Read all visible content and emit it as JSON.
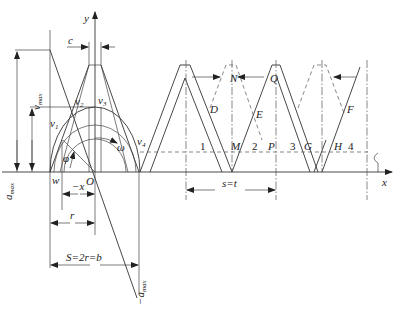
{
  "figure": {
    "type": "engineering diagram"
  },
  "axes": {
    "x_label": "x",
    "y_label": "y",
    "origin_label": "O"
  },
  "labels": {
    "v_max": "v",
    "v_max_sub": "max",
    "a_max": "a",
    "a_max_sub": "max",
    "neg_a_max": "−a",
    "neg_a_max_sub": "max",
    "c": "c",
    "v1": "v",
    "v1_sub": "1",
    "v2": "v",
    "v2_sub": "2",
    "v3": "v",
    "v3_sub": "3",
    "v4": "v",
    "v4_sub": "4",
    "omega": "ω",
    "phi": "φ",
    "w": "w",
    "neg_x": "−x",
    "r": "r",
    "S_eq": "S=2r=b",
    "s_eq_t": "s=t",
    "points": [
      "D",
      "N",
      "Q",
      "E",
      "F",
      "M",
      "P",
      "G",
      "H"
    ],
    "zones": [
      "1",
      "2",
      "3",
      "4"
    ]
  },
  "point_labels": {
    "D": "D",
    "N": "N",
    "Q": "Q",
    "E": "E",
    "F": "F",
    "M": "M",
    "P": "P",
    "G": "G",
    "H": "H"
  },
  "zone_labels": {
    "z1": "1",
    "z2": "2",
    "z3": "3",
    "z4": "4"
  }
}
